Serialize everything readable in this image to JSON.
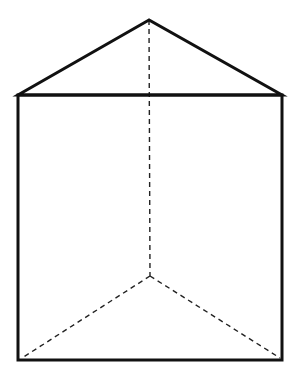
{
  "diagram": {
    "type": "triangular-prism",
    "colors": {
      "stroke": "#111111",
      "background": "#ffffff"
    },
    "vertices": {
      "apex_top": [
        149,
        20
      ],
      "front_top_left": [
        18,
        95
      ],
      "front_top_right": [
        282,
        95
      ],
      "front_bottom_left": [
        18,
        360
      ],
      "front_bottom_right": [
        282,
        360
      ],
      "back_bottom": [
        150,
        276
      ]
    }
  }
}
